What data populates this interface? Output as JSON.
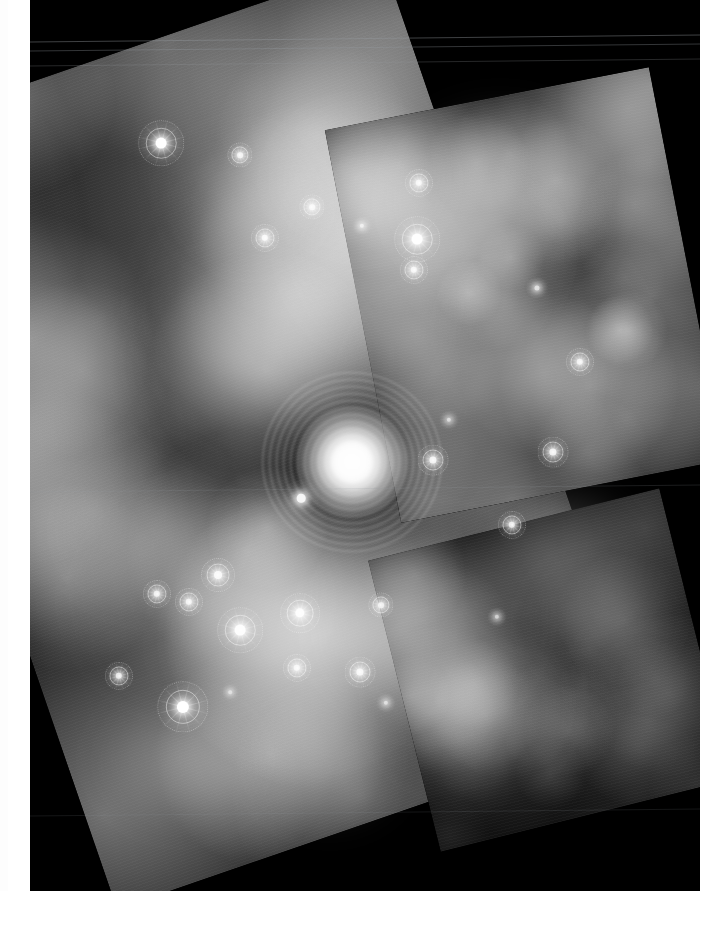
{
  "document": {
    "type": "astronomical-image",
    "title": "Infrared mosaic of a star-forming nebula",
    "medium": "printed-page-scan",
    "page_background": "#ffffff",
    "sky_background": "#000000"
  },
  "layout": {
    "canvas": {
      "width": 728,
      "height": 926
    },
    "margins": {
      "left_strip": {
        "x": 8,
        "y": 0,
        "width": 22,
        "height": 891,
        "color": "#ffffff"
      },
      "right_strip": {
        "x": 700,
        "y": 0,
        "width": 28,
        "height": 891,
        "color": "#ffffff"
      },
      "bottom_band": {
        "x": 0,
        "y": 891,
        "width": 728,
        "height": 35,
        "color": "#ffffff"
      }
    },
    "sky_frame": {
      "x": 30,
      "y": 0,
      "width": 670,
      "height": 891
    }
  },
  "detector_stripes": [
    {
      "y": 38,
      "opacity": 0.42
    },
    {
      "y": 47,
      "opacity": 0.34
    },
    {
      "y": 62,
      "opacity": 0.25
    },
    {
      "y": 488,
      "opacity": 0.18
    },
    {
      "y": 812,
      "opacity": 0.14
    }
  ],
  "mosaic_tiles": [
    {
      "name": "primary-tile",
      "rotation_deg": -19,
      "x": -60,
      "y": 30,
      "width": 560,
      "height": 810,
      "note": "large rotated detector footprint covering centre of field"
    },
    {
      "name": "secondary-tile",
      "rotation_deg": -11,
      "x": 330,
      "y": 95,
      "width": 330,
      "height": 400,
      "note": "upper-right overlapping footprint"
    },
    {
      "name": "lower-right-tile",
      "rotation_deg": -14,
      "x": 370,
      "y": 520,
      "width": 300,
      "height": 300,
      "note": "faint lower-right footprint"
    }
  ],
  "core_cluster": {
    "name": "saturated-central-cluster",
    "x": 352,
    "y": 462,
    "radius": 54,
    "ring_radius": 92,
    "brightness": "saturated",
    "color": "#ffffff"
  },
  "nebulosity": [
    {
      "x": 300,
      "y": 300,
      "rx": 150,
      "ry": 130,
      "intensity": 0.52
    },
    {
      "x": 420,
      "y": 250,
      "rx": 130,
      "ry": 110,
      "intensity": 0.55
    },
    {
      "x": 500,
      "y": 200,
      "rx": 110,
      "ry": 95,
      "intensity": 0.48
    },
    {
      "x": 250,
      "y": 360,
      "rx": 120,
      "ry": 100,
      "intensity": 0.4
    },
    {
      "x": 470,
      "y": 380,
      "rx": 120,
      "ry": 100,
      "intensity": 0.44
    },
    {
      "x": 540,
      "y": 330,
      "rx": 95,
      "ry": 85,
      "intensity": 0.38
    },
    {
      "x": 200,
      "y": 600,
      "rx": 120,
      "ry": 105,
      "intensity": 0.42
    },
    {
      "x": 300,
      "y": 640,
      "rx": 130,
      "ry": 110,
      "intensity": 0.46
    },
    {
      "x": 420,
      "y": 620,
      "rx": 110,
      "ry": 100,
      "intensity": 0.5
    },
    {
      "x": 470,
      "y": 700,
      "rx": 95,
      "ry": 85,
      "intensity": 0.4
    },
    {
      "x": 150,
      "y": 530,
      "rx": 90,
      "ry": 80,
      "intensity": 0.34
    },
    {
      "x": 560,
      "y": 560,
      "rx": 90,
      "ry": 80,
      "intensity": 0.36
    },
    {
      "x": 600,
      "y": 620,
      "rx": 70,
      "ry": 60,
      "intensity": 0.28
    },
    {
      "x": 360,
      "y": 180,
      "rx": 90,
      "ry": 75,
      "intensity": 0.34
    },
    {
      "x": 250,
      "y": 200,
      "rx": 80,
      "ry": 70,
      "intensity": 0.26
    },
    {
      "x": 180,
      "y": 760,
      "rx": 85,
      "ry": 70,
      "intensity": 0.22
    },
    {
      "x": 330,
      "y": 760,
      "rx": 80,
      "ry": 70,
      "intensity": 0.26
    }
  ],
  "stars": [
    {
      "x": 161,
      "y": 143,
      "size": 15,
      "brightness": 1.0,
      "rings": true
    },
    {
      "x": 240,
      "y": 155,
      "size": 8,
      "brightness": 0.8,
      "rings": true
    },
    {
      "x": 312,
      "y": 207,
      "size": 8,
      "brightness": 0.78,
      "rings": true
    },
    {
      "x": 265,
      "y": 238,
      "size": 9,
      "brightness": 0.85,
      "rings": true
    },
    {
      "x": 362,
      "y": 226,
      "size": 6,
      "brightness": 0.68,
      "rings": false
    },
    {
      "x": 417,
      "y": 239,
      "size": 15,
      "brightness": 0.98,
      "rings": true
    },
    {
      "x": 414,
      "y": 270,
      "size": 9,
      "brightness": 0.82,
      "rings": true
    },
    {
      "x": 419,
      "y": 183,
      "size": 9,
      "brightness": 0.8,
      "rings": true
    },
    {
      "x": 537,
      "y": 288,
      "size": 7,
      "brightness": 0.7,
      "rings": false
    },
    {
      "x": 580,
      "y": 362,
      "size": 9,
      "brightness": 0.8,
      "rings": true
    },
    {
      "x": 553,
      "y": 452,
      "size": 10,
      "brightness": 0.86,
      "rings": true
    },
    {
      "x": 433,
      "y": 460,
      "size": 10,
      "brightness": 0.86,
      "rings": true
    },
    {
      "x": 512,
      "y": 525,
      "size": 9,
      "brightness": 0.8,
      "rings": true
    },
    {
      "x": 301,
      "y": 498,
      "size": 12,
      "brightness": 0.92,
      "rings": false
    },
    {
      "x": 218,
      "y": 575,
      "size": 11,
      "brightness": 0.88,
      "rings": true
    },
    {
      "x": 157,
      "y": 594,
      "size": 9,
      "brightness": 0.8,
      "rings": true
    },
    {
      "x": 189,
      "y": 602,
      "size": 9,
      "brightness": 0.8,
      "rings": true
    },
    {
      "x": 300,
      "y": 613,
      "size": 13,
      "brightness": 0.94,
      "rings": true
    },
    {
      "x": 240,
      "y": 630,
      "size": 15,
      "brightness": 0.96,
      "rings": true
    },
    {
      "x": 381,
      "y": 605,
      "size": 8,
      "brightness": 0.76,
      "rings": true
    },
    {
      "x": 297,
      "y": 668,
      "size": 9,
      "brightness": 0.8,
      "rings": true
    },
    {
      "x": 360,
      "y": 672,
      "size": 10,
      "brightness": 0.84,
      "rings": true
    },
    {
      "x": 119,
      "y": 676,
      "size": 9,
      "brightness": 0.8,
      "rings": true
    },
    {
      "x": 183,
      "y": 707,
      "size": 17,
      "brightness": 1.0,
      "rings": true
    },
    {
      "x": 386,
      "y": 703,
      "size": 6,
      "brightness": 0.62,
      "rings": false
    },
    {
      "x": 230,
      "y": 692,
      "size": 5,
      "brightness": 0.55,
      "rings": false
    },
    {
      "x": 497,
      "y": 617,
      "size": 6,
      "brightness": 0.6,
      "rings": false
    },
    {
      "x": 449,
      "y": 420,
      "size": 6,
      "brightness": 0.62,
      "rings": false
    }
  ]
}
